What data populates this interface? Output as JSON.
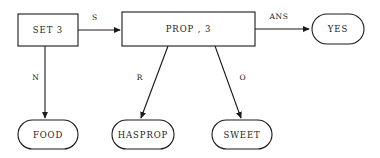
{
  "diagram": {
    "type": "flowchart",
    "canvas": {
      "width": 380,
      "height": 158,
      "background": "#ffffff"
    },
    "style": {
      "stroke_color": "#1a1a1a",
      "fill_color": "#ffffff"
    },
    "nodes": [
      {
        "id": "set3",
        "label": "SET 3",
        "shape": "rectangle",
        "x": 18,
        "y": 14,
        "w": 60,
        "h": 32
      },
      {
        "id": "prop3",
        "label": "PROP , 3",
        "shape": "rectangle",
        "x": 122,
        "y": 12,
        "w": 133,
        "h": 34
      },
      {
        "id": "yes",
        "label": "YES",
        "shape": "stadium",
        "x": 312,
        "y": 14,
        "w": 52,
        "h": 30
      },
      {
        "id": "food",
        "label": "FOOD",
        "shape": "stadium",
        "x": 18,
        "y": 120,
        "w": 60,
        "h": 29
      },
      {
        "id": "hasprop",
        "label": "HASPROP",
        "shape": "stadium",
        "x": 112,
        "y": 120,
        "w": 62,
        "h": 29
      },
      {
        "id": "sweet",
        "label": "SWEET",
        "shape": "stadium",
        "x": 212,
        "y": 120,
        "w": 60,
        "h": 29
      }
    ],
    "edges": [
      {
        "id": "edge-s",
        "from": "set3",
        "to": "prop3",
        "label": "S",
        "x1": 78,
        "y1": 30,
        "x2": 120,
        "y2": 30,
        "label_x": 95,
        "label_y": 18,
        "arrowhead": true
      },
      {
        "id": "edge-ans",
        "from": "prop3",
        "to": "yes",
        "label": "ANS",
        "x1": 255,
        "y1": 29,
        "x2": 310,
        "y2": 29,
        "label_x": 279,
        "label_y": 17,
        "arrowhead": true
      },
      {
        "id": "edge-n",
        "from": "set3",
        "to": "food",
        "label": "N",
        "x1": 45,
        "y1": 46,
        "x2": 45,
        "y2": 118,
        "label_x": 36,
        "label_y": 78,
        "arrowhead": true
      },
      {
        "id": "edge-r",
        "from": "prop3",
        "to": "hasprop",
        "label": "R",
        "x1": 168,
        "y1": 46,
        "x2": 141,
        "y2": 118,
        "label_x": 140,
        "label_y": 78,
        "arrowhead": true
      },
      {
        "id": "edge-o",
        "from": "prop3",
        "to": "sweet",
        "label": "O",
        "x1": 215,
        "y1": 46,
        "x2": 241,
        "y2": 118,
        "label_x": 243,
        "label_y": 78,
        "arrowhead": true
      }
    ]
  }
}
